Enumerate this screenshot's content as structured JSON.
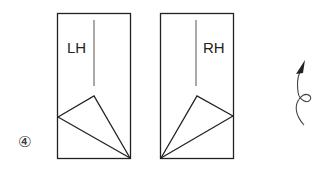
{
  "diagram": {
    "step_marker": "④",
    "panels": [
      {
        "id": "left",
        "label": "LH"
      },
      {
        "id": "right",
        "label": "RH"
      }
    ],
    "icons": {
      "rotation_arrow": "curved-rotation-arrow-icon"
    },
    "colors": {
      "stroke": "#222222",
      "background": "#ffffff"
    }
  }
}
